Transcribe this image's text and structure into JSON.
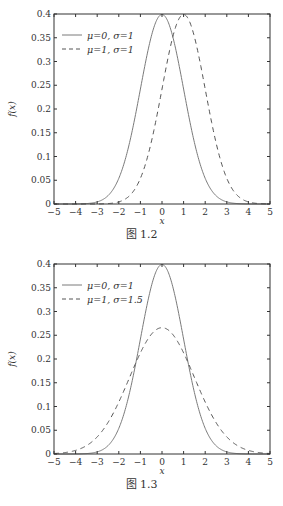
{
  "chart_data": [
    {
      "type": "line",
      "title": "",
      "caption": "图 1.2",
      "xlabel": "x",
      "ylabel": "f(x)",
      "xlim": [
        -5,
        5
      ],
      "ylim": [
        0,
        0.4
      ],
      "xticks": [
        -5,
        -4,
        -3,
        -2,
        -1,
        0,
        1,
        2,
        3,
        4,
        5
      ],
      "yticks": [
        0,
        0.05,
        0.1,
        0.15,
        0.2,
        0.25,
        0.3,
        0.35,
        0.4
      ],
      "ytick_labels": [
        "0",
        "0.05",
        "0.1",
        "0.15",
        "0.2",
        "0.25",
        "0.3",
        "0.35",
        "0.4"
      ],
      "grid": false,
      "legend_position": "upper left",
      "series": [
        {
          "name": "μ=0, σ=1",
          "style": "solid",
          "mu": 0,
          "sigma": 1,
          "x": [
            -5,
            -4,
            -3,
            -2,
            -1,
            0,
            1,
            2,
            3,
            4,
            5
          ],
          "values": [
            0.0,
            0.0001,
            0.0044,
            0.054,
            0.242,
            0.3989,
            0.242,
            0.054,
            0.0044,
            0.0001,
            0.0
          ]
        },
        {
          "name": "μ=1, σ=1",
          "style": "dashed",
          "mu": 1,
          "sigma": 1,
          "x": [
            -5,
            -4,
            -3,
            -2,
            -1,
            0,
            1,
            2,
            3,
            4,
            5
          ],
          "values": [
            0.0,
            0.0,
            0.0001,
            0.0044,
            0.054,
            0.242,
            0.3989,
            0.242,
            0.054,
            0.0044,
            0.0001
          ]
        }
      ]
    },
    {
      "type": "line",
      "title": "",
      "caption": "图 1.3",
      "xlabel": "x",
      "ylabel": "f(x)",
      "xlim": [
        -5,
        5
      ],
      "ylim": [
        0,
        0.4
      ],
      "xticks": [
        -5,
        -4,
        -3,
        -2,
        -1,
        0,
        1,
        2,
        3,
        4,
        5
      ],
      "yticks": [
        0,
        0.05,
        0.1,
        0.15,
        0.2,
        0.25,
        0.3,
        0.35,
        0.4
      ],
      "ytick_labels": [
        "0",
        "0.05",
        "0.1",
        "0.15",
        "0.2",
        "0.25",
        "0.3",
        "0.35",
        "0.4"
      ],
      "grid": false,
      "legend_position": "upper left",
      "series": [
        {
          "name": "μ=0, σ=1",
          "style": "solid",
          "mu": 0,
          "sigma": 1,
          "x": [
            -5,
            -4,
            -3,
            -2,
            -1,
            0,
            1,
            2,
            3,
            4,
            5
          ],
          "values": [
            0.0,
            0.0001,
            0.0044,
            0.054,
            0.242,
            0.3989,
            0.242,
            0.054,
            0.0044,
            0.0001,
            0.0
          ]
        },
        {
          "name": "μ=1, σ=1.5",
          "style": "dashed",
          "mu": 0,
          "sigma": 1.5,
          "x": [
            -5,
            -4,
            -3,
            -2,
            -1,
            0,
            1,
            2,
            3,
            4,
            5
          ],
          "values": [
            0.001,
            0.0076,
            0.036,
            0.1093,
            0.213,
            0.266,
            0.213,
            0.1093,
            0.036,
            0.0076,
            0.001
          ]
        }
      ]
    }
  ],
  "colors": {
    "solid_line": "#7a7a7a",
    "dashed_line": "#555555",
    "axes": "#333333"
  }
}
